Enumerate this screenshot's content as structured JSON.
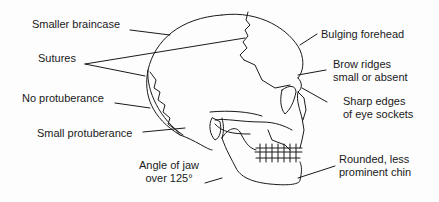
{
  "diagram": {
    "labels": {
      "smaller_braincase": "Smaller braincase",
      "sutures": "Sutures",
      "no_protuberance": "No protuberance",
      "small_protuberance": "Small protuberance",
      "angle_of_jaw_1": "Angle of jaw",
      "angle_of_jaw_2": "over  125°",
      "bulging_forehead": "Bulging forehead",
      "brow_ridges_1": "Brow ridges",
      "brow_ridges_2": "small or absent",
      "sharp_edges_1": "Sharp edges",
      "sharp_edges_2": "of eye sockets",
      "rounded_chin_1": "Rounded, less",
      "rounded_chin_2": "prominent chin"
    },
    "line_color": "#1a1a1a",
    "background": "#fdfdfd"
  }
}
